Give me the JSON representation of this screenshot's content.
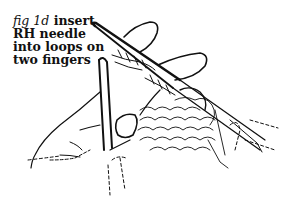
{
  "figure": {
    "label": "fig 1d",
    "caption_line1": "insert",
    "caption_line2": "RH needle",
    "caption_line3": "into loops on",
    "caption_line4": "two fingers"
  },
  "illustration": {
    "subject": "hand holding knitting needle inserted into yarn loops over two fingers",
    "stroke_color": "#111111",
    "background_color": "#ffffff"
  }
}
